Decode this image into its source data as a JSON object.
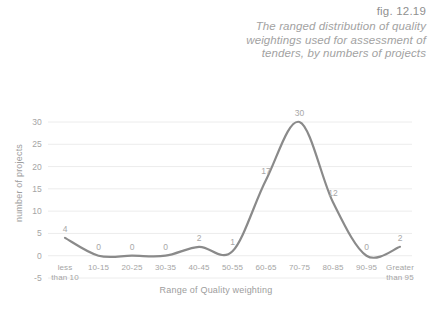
{
  "caption": {
    "figure_number": "fig. 12.19",
    "description": "The ranged distribution of quality weightings used for assessment of tenders, by numbers of projects"
  },
  "chart_data": {
    "type": "line",
    "title": "",
    "xlabel": "Range of Quality weighting",
    "ylabel": "number of projects",
    "categories": [
      "less than 10",
      "10-15",
      "20-25",
      "30-35",
      "40-45",
      "50-55",
      "60-65",
      "70-75",
      "80-85",
      "90-95",
      "Greater than 95"
    ],
    "values": [
      4,
      0,
      0,
      0,
      2,
      1,
      17,
      30,
      12,
      0,
      2
    ],
    "data_labels": [
      "4",
      "0",
      "0",
      "0",
      "2",
      "1",
      "17",
      "30",
      "12",
      "0",
      "2"
    ],
    "yticks": [
      -5,
      0,
      5,
      10,
      15,
      20,
      25,
      30
    ],
    "ytick_labels": [
      "-5",
      "0",
      "5",
      "10",
      "15",
      "20",
      "25",
      "30"
    ],
    "ylim": [
      -5,
      30
    ],
    "grid": true,
    "legend": false,
    "series_color": "#8a8a8a",
    "grid_color": "#ececec",
    "text_color": "#a5a5a5"
  }
}
